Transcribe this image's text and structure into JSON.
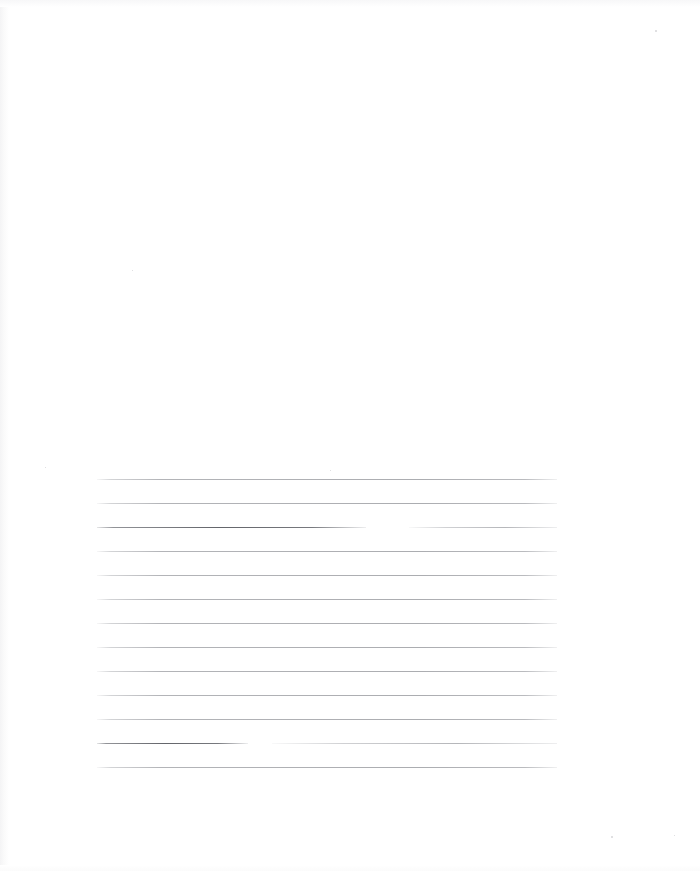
{
  "document": {
    "kind": "scanned-page",
    "title": "Blank ruled page",
    "page_background": "#ffffff",
    "rule_color": "#84868c",
    "stroke_color": "#56585e",
    "text_content": "",
    "visible_text": [],
    "ruled_area": {
      "left": 97,
      "right": 557,
      "top": 479,
      "bottom": 767,
      "line_spacing": 24,
      "line_count": 13
    },
    "lines": [
      {
        "index": 1,
        "y": 479,
        "x_start": 97,
        "x_end": 557,
        "style": "faint",
        "gap": null
      },
      {
        "index": 2,
        "y": 503,
        "x_start": 97,
        "x_end": 557,
        "style": "faint",
        "gap": null
      },
      {
        "index": 3,
        "y": 527,
        "x_start": 97,
        "x_end": 557,
        "style": "stroke",
        "gap": {
          "from": 366,
          "to": 409
        }
      },
      {
        "index": 4,
        "y": 551,
        "x_start": 97,
        "x_end": 557,
        "style": "faint",
        "gap": null
      },
      {
        "index": 5,
        "y": 575,
        "x_start": 97,
        "x_end": 557,
        "style": "faint",
        "gap": null
      },
      {
        "index": 6,
        "y": 599,
        "x_start": 97,
        "x_end": 557,
        "style": "faint",
        "gap": null
      },
      {
        "index": 7,
        "y": 623,
        "x_start": 97,
        "x_end": 557,
        "style": "faint",
        "gap": null
      },
      {
        "index": 8,
        "y": 647,
        "x_start": 97,
        "x_end": 557,
        "style": "faint",
        "gap": null
      },
      {
        "index": 9,
        "y": 671,
        "x_start": 97,
        "x_end": 557,
        "style": "faint",
        "gap": null
      },
      {
        "index": 10,
        "y": 695,
        "x_start": 97,
        "x_end": 557,
        "style": "faint",
        "gap": null
      },
      {
        "index": 11,
        "y": 719,
        "x_start": 97,
        "x_end": 557,
        "style": "faint",
        "gap": null
      },
      {
        "index": 12,
        "y": 743,
        "x_start": 97,
        "x_end": 557,
        "style": "stroke",
        "gap": {
          "from": 248,
          "to": 272
        }
      },
      {
        "index": 13,
        "y": 767,
        "x_start": 97,
        "x_end": 557,
        "style": "faint",
        "gap": null
      }
    ],
    "specks": [
      {
        "x": 655,
        "y": 30,
        "size": 2
      },
      {
        "x": 611,
        "y": 836,
        "size": 2
      },
      {
        "x": 674,
        "y": 835,
        "size": 1
      },
      {
        "x": 330,
        "y": 470,
        "size": 1
      },
      {
        "x": 45,
        "y": 467,
        "size": 1
      },
      {
        "x": 132,
        "y": 270,
        "size": 1
      }
    ]
  }
}
